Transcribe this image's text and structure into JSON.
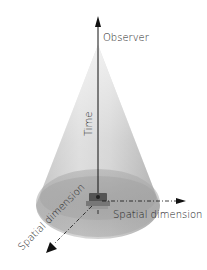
{
  "diagram": {
    "type": "light-cone",
    "labels": {
      "observer": "Observer",
      "time": "Time",
      "spatial_x": "Spatial dimension",
      "spatial_y": "Spatial dimension"
    },
    "colors": {
      "cone_light": "#e6e6e6",
      "cone_mid": "#bdbdbd",
      "cone_dark": "#9a9a9a",
      "axis": "#111111",
      "text": "#222222"
    }
  }
}
